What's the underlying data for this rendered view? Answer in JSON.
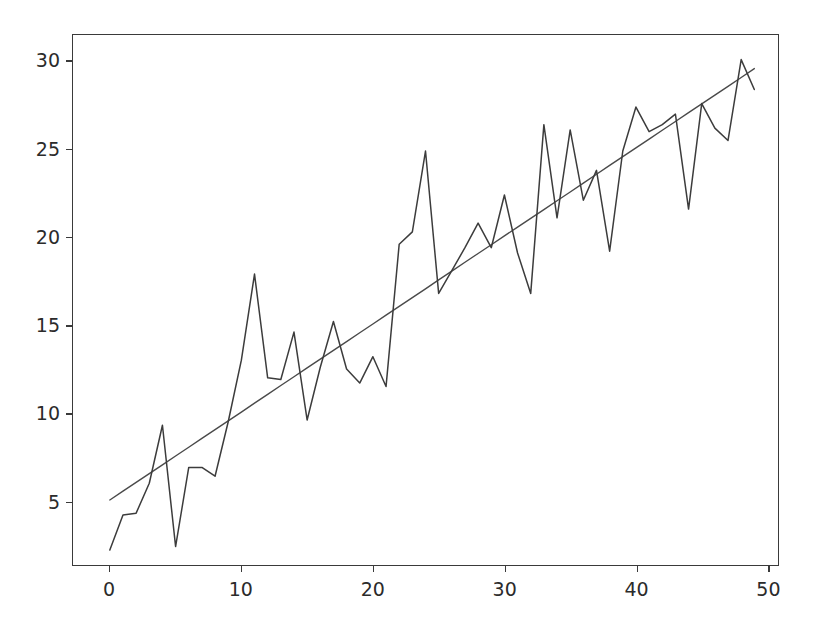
{
  "figure": {
    "width": 816,
    "height": 634,
    "background": "#ffffff"
  },
  "axes": {
    "frame_color": "#3a3a3a",
    "pixel_left": 72,
    "pixel_top": 34,
    "pixel_right": 779,
    "pixel_bottom": 566,
    "x_tick_labels": [
      "0",
      "10",
      "20",
      "30",
      "40",
      "50"
    ],
    "y_tick_labels": [
      "5",
      "10",
      "15",
      "20",
      "25",
      "30"
    ]
  },
  "chart_data": {
    "type": "line",
    "title": "",
    "subtitle": "",
    "xlabel": "",
    "ylabel": "",
    "xlim": [
      -2.8,
      50.8
    ],
    "ylim": [
      1.35,
      31.5
    ],
    "xticks": [
      0,
      10,
      20,
      30,
      40,
      50
    ],
    "yticks": [
      5,
      10,
      15,
      20,
      25,
      30
    ],
    "grid": false,
    "legend": null,
    "legend_position": "none",
    "annotations": [],
    "x": [
      0,
      1,
      2,
      3,
      4,
      5,
      6,
      7,
      8,
      9,
      10,
      11,
      12,
      13,
      14,
      15,
      16,
      17,
      18,
      19,
      20,
      21,
      22,
      23,
      24,
      25,
      26,
      27,
      28,
      29,
      30,
      31,
      32,
      33,
      34,
      35,
      36,
      37,
      38,
      39,
      40,
      41,
      42,
      43,
      44,
      45,
      46,
      47,
      48,
      49
    ],
    "series": [
      {
        "name": "noisy-signal",
        "color": "#3c3c3c",
        "linewidth": 1.5,
        "values": [
          2.2,
          4.2,
          4.3,
          6.0,
          9.3,
          2.4,
          6.9,
          6.9,
          6.4,
          9.5,
          13.0,
          17.9,
          12.0,
          11.9,
          14.6,
          9.6,
          12.6,
          15.2,
          12.5,
          11.7,
          13.2,
          11.5,
          19.6,
          20.3,
          24.9,
          16.8,
          18.1,
          19.4,
          20.8,
          19.4,
          22.4,
          19.1,
          16.8,
          26.4,
          21.1,
          26.1,
          22.1,
          23.8,
          19.2,
          24.9,
          27.4,
          26.0,
          26.4,
          27.0,
          21.6,
          27.6,
          26.2,
          25.5,
          30.1,
          28.4
        ]
      },
      {
        "name": "trend-line",
        "color": "#4a4a4a",
        "linewidth": 1.4,
        "values": [
          5.05,
          5.55,
          6.05,
          6.55,
          7.05,
          7.55,
          8.05,
          8.55,
          9.05,
          9.55,
          10.05,
          10.56,
          11.06,
          11.56,
          12.06,
          12.56,
          13.06,
          13.56,
          14.06,
          14.56,
          15.06,
          15.56,
          16.06,
          16.56,
          17.06,
          17.57,
          18.07,
          18.57,
          19.07,
          19.57,
          20.07,
          20.57,
          21.07,
          21.57,
          22.07,
          22.57,
          23.07,
          23.58,
          24.08,
          24.58,
          25.08,
          25.58,
          26.08,
          26.58,
          27.08,
          27.58,
          28.08,
          28.58,
          29.08,
          29.59
        ]
      }
    ]
  }
}
